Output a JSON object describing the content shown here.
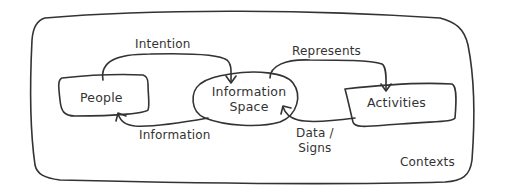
{
  "diagram": {
    "container": {
      "label": "Contexts"
    },
    "nodes": [
      {
        "id": "people",
        "label": "People",
        "shape": "rounded-rect"
      },
      {
        "id": "information-space",
        "label_line1": "Information",
        "label_line2": "Space",
        "shape": "ellipse"
      },
      {
        "id": "activities",
        "label": "Activities",
        "shape": "rounded-rect"
      }
    ],
    "edges": [
      {
        "from": "people",
        "to": "information-space",
        "label": "Intention"
      },
      {
        "from": "information-space",
        "to": "people",
        "label": "Information"
      },
      {
        "from": "information-space",
        "to": "activities",
        "label": "Represents"
      },
      {
        "from": "activities",
        "to": "information-space",
        "label_line1": "Data /",
        "label_line2": "Signs"
      }
    ],
    "stroke_color": "#333333"
  }
}
